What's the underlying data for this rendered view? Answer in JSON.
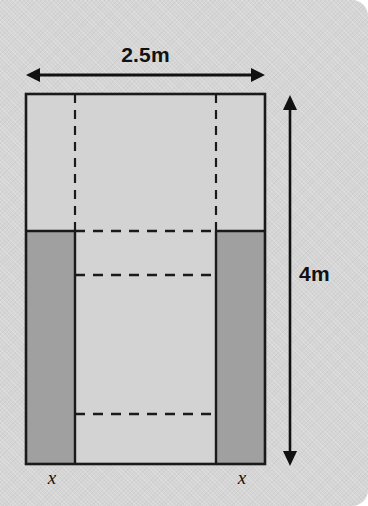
{
  "diagram": {
    "background_color": "#d5d5d5",
    "outline_color": "#1a1a1a",
    "interior_fill": "#d3d3d3",
    "shaded_fill": "#a0a0a0",
    "dimensions": {
      "width_label": "2.5m",
      "height_label": "4m",
      "strip_label_left": "x",
      "strip_label_right": "x"
    },
    "icons": {
      "width_arrow": "double-headed-horizontal-arrow-icon",
      "height_arrow": "double-headed-vertical-arrow-icon"
    },
    "geometry": {
      "outer_rect": {
        "x": 26,
        "y": 94,
        "width": 239,
        "height": 370
      },
      "inner_vertical_lines_x": [
        75,
        216
      ],
      "shaded_top_y": 231,
      "dashed_horizontal_lines_y": [
        231,
        275,
        414
      ],
      "width_arrow": {
        "y": 75,
        "x1": 26,
        "x2": 265
      },
      "height_arrow": {
        "x": 290,
        "y1": 97,
        "y2": 464
      }
    }
  }
}
